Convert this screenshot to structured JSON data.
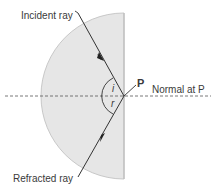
{
  "diagram": {
    "labels": {
      "incident_ray": "Incident ray",
      "refracted_ray": "Refracted ray",
      "point": "P",
      "normal": "Normal at P",
      "angle_incidence": "i",
      "angle_refraction": "r"
    },
    "colors": {
      "block_fill": "#e6e6e6",
      "block_edge": "#c8c8c8",
      "ray": "#333333",
      "normal": "#555555",
      "text": "#3a3a3a"
    },
    "geometry": {
      "block_center": [
        124,
        96
      ],
      "block_radius": 83,
      "point_P": [
        124,
        96
      ]
    }
  }
}
